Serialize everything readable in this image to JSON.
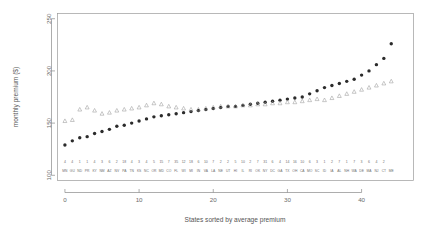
{
  "chart_data": {
    "type": "scatter",
    "title": "",
    "xlabel": "States sorted by average premium",
    "ylabel": "monthly premium ($)",
    "xlim": [
      -1,
      47
    ],
    "ylim": [
      95,
      255
    ],
    "xticks": [
      0,
      10,
      20,
      30,
      40
    ],
    "yticks": [
      100,
      150,
      200,
      250
    ],
    "grid": false,
    "legend_position": "none",
    "categories": [
      "MN",
      "GU",
      "ND",
      "PR",
      "KY",
      "NM",
      "AZ",
      "NV",
      "PA",
      "TN",
      "KS",
      "NC",
      "OR",
      "MD",
      "CO",
      "FL",
      "WI",
      "MI",
      "IN",
      "VA",
      "LA",
      "NE",
      "UT",
      "HI",
      "IL",
      "RI",
      "OK",
      "NY",
      "DC",
      "GA",
      "TX",
      "OH",
      "CA",
      "MO",
      "SC",
      "ID",
      "IA",
      "AL",
      "NH",
      "WA",
      "DE",
      "MA",
      "NJ",
      "CT",
      "ME"
    ],
    "category_counts": [
      "4",
      "4",
      "1",
      "1",
      "4",
      "3",
      "6",
      "2",
      "18",
      "4",
      "3",
      "4",
      "5",
      "15",
      "7",
      "35",
      "12",
      "18",
      "6",
      "10",
      "7",
      "2",
      "2",
      "5",
      "10",
      "2",
      "7",
      "31",
      "6",
      "4",
      "14",
      "16",
      "10",
      "6",
      "3",
      "1",
      "2",
      "7",
      "1",
      "7",
      "3",
      "6",
      "4",
      "2"
    ],
    "series": [
      {
        "name": "average premium",
        "marker": "filled-circle",
        "color": "#2b2b2b",
        "values": [
          129,
          133,
          136,
          137,
          140,
          142,
          144,
          147,
          148,
          150,
          152,
          154,
          156,
          157,
          158,
          159,
          160,
          161,
          162,
          163,
          164,
          165,
          166,
          166,
          167,
          168,
          169,
          170,
          171,
          172,
          173,
          174,
          175,
          178,
          181,
          184,
          186,
          188,
          190,
          192,
          196,
          200,
          206,
          212,
          226
        ]
      },
      {
        "name": "benchmark premium",
        "marker": "open-triangle",
        "color": "#9b9b9b",
        "values": [
          152,
          153,
          163,
          165,
          162,
          159,
          160,
          162,
          163,
          164,
          165,
          167,
          169,
          168,
          166,
          165,
          164,
          163,
          163,
          164,
          165,
          166,
          166,
          166,
          167,
          167,
          168,
          168,
          169,
          169,
          170,
          170,
          171,
          172,
          173,
          172,
          174,
          176,
          178,
          180,
          182,
          184,
          186,
          188,
          190
        ]
      }
    ]
  },
  "axis": {
    "y_label": "monthly premium ($)",
    "x_label": "States sorted by average premium",
    "y_tick_labels": [
      "100",
      "150",
      "200",
      "250"
    ],
    "x_tick_labels": [
      "0",
      "10",
      "20",
      "30",
      "40"
    ]
  }
}
